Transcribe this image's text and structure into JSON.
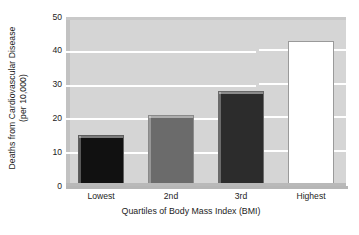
{
  "chart_data": {
    "type": "bar",
    "title": "",
    "subtitle": "",
    "xlabel": "Quartiles of Body Mass Index (BMI)",
    "ylabel_line1": "Deaths from Cardiovascular Disease",
    "ylabel_line2": "(per 10,000)",
    "ylabel": "Deaths from Cardiovascular Disease (per 10,000)",
    "categories": [
      "Lowest",
      "2nd",
      "3rd",
      "Highest"
    ],
    "values": [
      15,
      21,
      28,
      43
    ],
    "ylim": [
      0,
      50
    ],
    "yticks": [
      0,
      10,
      20,
      30,
      40,
      50
    ],
    "ytick_labels": [
      "0",
      "10",
      "20",
      "30",
      "40",
      "50"
    ],
    "grid": "horizontal-white-gridlines",
    "legend": "none",
    "bar_colors": [
      "#111111",
      "#6b6b6b",
      "#2c2c2c",
      "#ffffff"
    ],
    "bar_edge_colors": [
      "#5f5f5f",
      "#8a8a8a",
      "#6a6a6a",
      "#9a9a9a"
    ],
    "plot_background": "#d5d5d5",
    "figure_background": "#ffffff",
    "text_color": "#1c1c1c",
    "bars": [
      {
        "category": "Lowest",
        "value": 15,
        "color": "#111111",
        "edge": "#5f5f5f"
      },
      {
        "category": "2nd",
        "value": 21,
        "color": "#6b6b6b",
        "edge": "#8a8a8a"
      },
      {
        "category": "3rd",
        "value": 28,
        "color": "#2c2c2c",
        "edge": "#6a6a6a"
      },
      {
        "category": "Highest",
        "value": 43,
        "color": "#ffffff",
        "edge": "#9a9a9a"
      }
    ]
  }
}
